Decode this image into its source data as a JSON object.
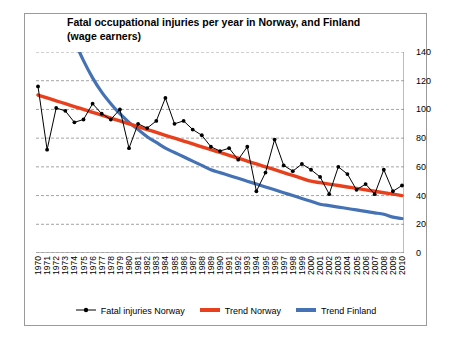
{
  "chart_data": {
    "type": "line",
    "title": "Fatal occupational injuries per year in Norway, and Finland (wage earners)",
    "xlabel": "",
    "ylabel": "",
    "ylim": [
      0,
      140
    ],
    "yticks": [
      0,
      20,
      40,
      60,
      80,
      100,
      120,
      140
    ],
    "grid": true,
    "y_axis_position": "right",
    "legend_position": "bottom",
    "x": [
      1970,
      1971,
      1972,
      1973,
      1974,
      1975,
      1976,
      1977,
      1978,
      1979,
      1980,
      1981,
      1982,
      1983,
      1984,
      1985,
      1986,
      1987,
      1988,
      1989,
      1990,
      1991,
      1992,
      1993,
      1994,
      1995,
      1996,
      1997,
      1998,
      1999,
      2000,
      2001,
      2002,
      2003,
      2004,
      2005,
      2006,
      2007,
      2008,
      2009,
      2010
    ],
    "categories": [
      "1970",
      "1971",
      "1972",
      "1973",
      "1974",
      "1975",
      "1976",
      "1977",
      "1978",
      "1979",
      "1980",
      "1981",
      "1982",
      "1983",
      "1984",
      "1985",
      "1986",
      "1987",
      "1988",
      "1989",
      "1990",
      "1991",
      "1992",
      "1993",
      "1994",
      "1995",
      "1996",
      "1997",
      "1998",
      "1999",
      "2000",
      "2001",
      "2002",
      "2003",
      "2004",
      "2005",
      "2006",
      "2007",
      "2008",
      "2009",
      "2010"
    ],
    "series": [
      {
        "name": "Fatal injuries Norway",
        "type": "line",
        "color": "#000000",
        "marker": "circle",
        "values": [
          116,
          72,
          101,
          99,
          91,
          93,
          104,
          97,
          93,
          100,
          73,
          90,
          87,
          92,
          108,
          90,
          92,
          86,
          82,
          74,
          71,
          73,
          65,
          74,
          43,
          56,
          79,
          61,
          57,
          62,
          58,
          53,
          41,
          60,
          55,
          44,
          48,
          41,
          58,
          43,
          47
        ]
      },
      {
        "name": "Trend Norway",
        "type": "trend-linear",
        "color": "#E8401C",
        "values": [
          110,
          108,
          106,
          104,
          102,
          100,
          98,
          96,
          94,
          92,
          90,
          88,
          86,
          84,
          82,
          80,
          78,
          76,
          74,
          72,
          70,
          68,
          66,
          64,
          62,
          60,
          58,
          56,
          54,
          52,
          50,
          49,
          48,
          47,
          46,
          45,
          44,
          43,
          42,
          41,
          40
        ]
      },
      {
        "name": "Trend Finland",
        "type": "trend-curve",
        "color": "#4472B4",
        "values": [
          230,
          205,
          183,
          164,
          148,
          134,
          122,
          112,
          104,
          97,
          91,
          86,
          81,
          77,
          73,
          70,
          67,
          64,
          61,
          58,
          56,
          54,
          52,
          50,
          48,
          46,
          44,
          42,
          40,
          38,
          36,
          34,
          33,
          32,
          31,
          30,
          29,
          28,
          27,
          25,
          24
        ]
      }
    ]
  },
  "legend": {
    "items": [
      {
        "label": "Fatal injuries Norway",
        "color": "#000000",
        "style": "line-marker"
      },
      {
        "label": "Trend Norway",
        "color": "#E8401C",
        "style": "thick-line"
      },
      {
        "label": "Trend Finland",
        "color": "#4472B4",
        "style": "thick-line"
      }
    ]
  }
}
